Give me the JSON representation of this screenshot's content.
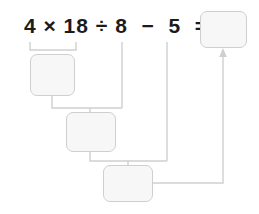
{
  "worksheet": {
    "equation": "4 × 18 ÷ 8  −  5  =",
    "equation_tokens": [
      "4",
      "×",
      "18",
      "÷",
      "8",
      "−",
      "5",
      "="
    ],
    "operands": [
      4,
      18,
      8,
      5
    ],
    "operators": [
      "×",
      "÷",
      "−"
    ],
    "line_color": "#cfcfcf",
    "box_fill": "#f7f7f7",
    "box_border": "#cfcfcf",
    "text_color": "#1b1b1b",
    "boxes": [
      {
        "name": "product",
        "value": ""
      },
      {
        "name": "quotient",
        "value": ""
      },
      {
        "name": "difference",
        "value": ""
      },
      {
        "name": "result",
        "value": ""
      }
    ]
  }
}
